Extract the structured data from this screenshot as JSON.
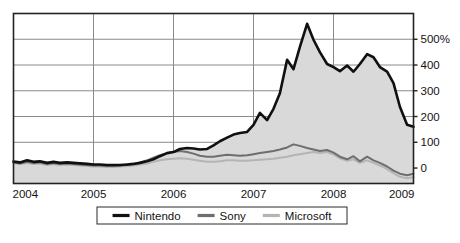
{
  "chart_data": {
    "type": "area",
    "title": "",
    "subtitle": "",
    "xlabel": "",
    "ylabel": "",
    "xlim": [
      2004,
      2009
    ],
    "ylim": [
      -60,
      600
    ],
    "yticks": [
      0,
      100,
      200,
      300,
      400,
      500
    ],
    "ytick_labels": [
      "0",
      "100",
      "200",
      "300",
      "400",
      "500%"
    ],
    "xticks": [
      2004,
      2005,
      2006,
      2007,
      2008,
      2009
    ],
    "xtick_labels": [
      "2004",
      "2005",
      "2006",
      "2007",
      "2008",
      "2009"
    ],
    "grid": true,
    "legend_position": "bottom",
    "colors": {
      "nintendo": "#101010",
      "sony": "#6e6e6e",
      "microsoft": "#b4b4b4",
      "area_fill": "#d9d9d9",
      "grid": "#8a8a8a",
      "frame": "#222222",
      "background": "#ffffff"
    },
    "series": [
      {
        "name": "Nintendo",
        "color": "#101010",
        "filled": true,
        "x": [
          2004.0,
          2004.08,
          2004.17,
          2004.25,
          2004.33,
          2004.42,
          2004.5,
          2004.58,
          2004.67,
          2004.75,
          2004.83,
          2004.92,
          2005.0,
          2005.08,
          2005.17,
          2005.25,
          2005.33,
          2005.42,
          2005.5,
          2005.58,
          2005.67,
          2005.75,
          2005.83,
          2005.92,
          2006.0,
          2006.08,
          2006.17,
          2006.25,
          2006.33,
          2006.42,
          2006.5,
          2006.58,
          2006.67,
          2006.75,
          2006.83,
          2006.92,
          2007.0,
          2007.08,
          2007.17,
          2007.25,
          2007.33,
          2007.42,
          2007.5,
          2007.58,
          2007.67,
          2007.75,
          2007.83,
          2007.92,
          2008.0,
          2008.08,
          2008.17,
          2008.25,
          2008.33,
          2008.42,
          2008.5,
          2008.58,
          2008.67,
          2008.75,
          2008.83,
          2008.92,
          2009.0
        ],
        "values": [
          25,
          22,
          30,
          24,
          26,
          20,
          24,
          20,
          22,
          20,
          18,
          16,
          14,
          14,
          12,
          12,
          12,
          14,
          16,
          20,
          26,
          34,
          46,
          58,
          62,
          74,
          78,
          76,
          72,
          74,
          88,
          104,
          118,
          130,
          136,
          140,
          168,
          214,
          186,
          230,
          290,
          420,
          384,
          470,
          560,
          498,
          450,
          404,
          392,
          376,
          398,
          374,
          404,
          442,
          430,
          392,
          374,
          330,
          238,
          168,
          160
        ]
      },
      {
        "name": "Sony",
        "color": "#6e6e6e",
        "filled": false,
        "x": [
          2004.0,
          2004.08,
          2004.17,
          2004.25,
          2004.33,
          2004.42,
          2004.5,
          2004.58,
          2004.67,
          2004.75,
          2004.83,
          2004.92,
          2005.0,
          2005.08,
          2005.17,
          2005.25,
          2005.33,
          2005.42,
          2005.5,
          2005.58,
          2005.67,
          2005.75,
          2005.83,
          2005.92,
          2006.0,
          2006.08,
          2006.17,
          2006.25,
          2006.33,
          2006.42,
          2006.5,
          2006.58,
          2006.67,
          2006.75,
          2006.83,
          2006.92,
          2007.0,
          2007.08,
          2007.17,
          2007.25,
          2007.33,
          2007.42,
          2007.5,
          2007.58,
          2007.67,
          2007.75,
          2007.83,
          2007.92,
          2008.0,
          2008.08,
          2008.17,
          2008.25,
          2008.33,
          2008.42,
          2008.5,
          2008.58,
          2008.67,
          2008.75,
          2008.83,
          2008.92,
          2009.0
        ],
        "values": [
          22,
          18,
          24,
          20,
          22,
          16,
          20,
          16,
          18,
          16,
          14,
          12,
          10,
          10,
          8,
          8,
          10,
          12,
          16,
          22,
          30,
          40,
          50,
          58,
          62,
          66,
          62,
          56,
          48,
          44,
          44,
          48,
          52,
          50,
          48,
          50,
          54,
          58,
          62,
          66,
          72,
          80,
          92,
          86,
          78,
          72,
          66,
          70,
          60,
          44,
          34,
          46,
          26,
          44,
          30,
          20,
          6,
          -10,
          -22,
          -28,
          -22
        ]
      },
      {
        "name": "Microsoft",
        "color": "#b4b4b4",
        "filled": false,
        "x": [
          2004.0,
          2004.08,
          2004.17,
          2004.25,
          2004.33,
          2004.42,
          2004.5,
          2004.58,
          2004.67,
          2004.75,
          2004.83,
          2004.92,
          2005.0,
          2005.08,
          2005.17,
          2005.25,
          2005.33,
          2005.42,
          2005.5,
          2005.58,
          2005.67,
          2005.75,
          2005.83,
          2005.92,
          2006.0,
          2006.08,
          2006.17,
          2006.25,
          2006.33,
          2006.42,
          2006.5,
          2006.58,
          2006.67,
          2006.75,
          2006.83,
          2006.92,
          2007.0,
          2007.08,
          2007.17,
          2007.25,
          2007.33,
          2007.42,
          2007.5,
          2007.58,
          2007.67,
          2007.75,
          2007.83,
          2007.92,
          2008.0,
          2008.08,
          2008.17,
          2008.25,
          2008.33,
          2008.42,
          2008.5,
          2008.58,
          2008.67,
          2008.75,
          2008.83,
          2008.92,
          2009.0
        ],
        "values": [
          20,
          16,
          20,
          16,
          18,
          12,
          16,
          12,
          14,
          12,
          10,
          8,
          6,
          6,
          4,
          4,
          6,
          8,
          10,
          14,
          18,
          24,
          30,
          34,
          36,
          38,
          36,
          32,
          28,
          24,
          24,
          26,
          30,
          30,
          28,
          28,
          30,
          32,
          34,
          36,
          40,
          44,
          50,
          54,
          58,
          62,
          58,
          62,
          52,
          38,
          28,
          34,
          20,
          30,
          20,
          10,
          -4,
          -20,
          -34,
          -40,
          -36
        ]
      }
    ]
  },
  "legend": {
    "items": [
      {
        "label": "Nintendo",
        "swatch_color": "#101010"
      },
      {
        "label": "Sony",
        "swatch_color": "#6e6e6e"
      },
      {
        "label": "Microsoft",
        "swatch_color": "#b4b4b4"
      }
    ]
  }
}
